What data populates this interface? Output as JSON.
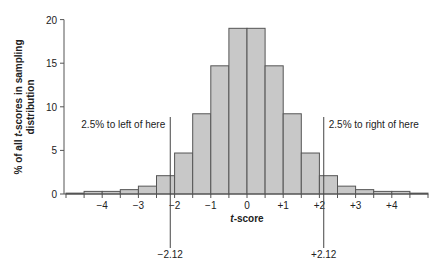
{
  "chart_data": {
    "type": "bar",
    "title": "",
    "xlabel": "t-score",
    "ylabel": "% of all t-scores in sampling distribution",
    "ylabel_lines": [
      "% of all t-scores in sampling",
      "distribution"
    ],
    "ylim": [
      0,
      20
    ],
    "xlim": [
      -5,
      5
    ],
    "grid": false,
    "bin_width": 0.5,
    "bins": [
      [
        -5.0,
        -4.5
      ],
      [
        -4.5,
        -4.0
      ],
      [
        -4.0,
        -3.5
      ],
      [
        -3.5,
        -3.0
      ],
      [
        -3.0,
        -2.5
      ],
      [
        -2.5,
        -2.0
      ],
      [
        -2.0,
        -1.5
      ],
      [
        -1.5,
        -1.0
      ],
      [
        -1.0,
        -0.5
      ],
      [
        -0.5,
        0.0
      ],
      [
        0.0,
        0.5
      ],
      [
        0.5,
        1.0
      ],
      [
        1.0,
        1.5
      ],
      [
        1.5,
        2.0
      ],
      [
        2.0,
        2.5
      ],
      [
        2.5,
        3.0
      ],
      [
        3.0,
        3.5
      ],
      [
        3.5,
        4.0
      ],
      [
        4.0,
        4.5
      ],
      [
        4.5,
        5.0
      ]
    ],
    "values": [
      0.1,
      0.3,
      0.3,
      0.5,
      0.9,
      2.1,
      4.7,
      9.2,
      14.7,
      19.0,
      19.0,
      14.7,
      9.2,
      4.7,
      2.1,
      0.9,
      0.5,
      0.3,
      0.3,
      0.1
    ],
    "y_ticks": [
      0,
      5,
      10,
      15,
      20
    ],
    "x_ticks": [
      {
        "value": -4,
        "label": "−4"
      },
      {
        "value": -3,
        "label": "−3"
      },
      {
        "value": -2,
        "label": "−2"
      },
      {
        "value": -1,
        "label": "−1"
      },
      {
        "value": 0,
        "label": "0"
      },
      {
        "value": 1,
        "label": "+1"
      },
      {
        "value": 2,
        "label": "+2"
      },
      {
        "value": 3,
        "label": "+3"
      },
      {
        "value": 4,
        "label": "+4"
      }
    ],
    "critical_lines": [
      {
        "value": -2.12,
        "label": "−2.12",
        "annotation": "2.5% to left of here"
      },
      {
        "value": 2.12,
        "label": "+2.12",
        "annotation": "2.5% to right of here"
      }
    ],
    "colors": {
      "bar_fill": "#c8c8c8",
      "bar_edge": "#555555",
      "axis": "#555555",
      "text": "#222222"
    }
  }
}
